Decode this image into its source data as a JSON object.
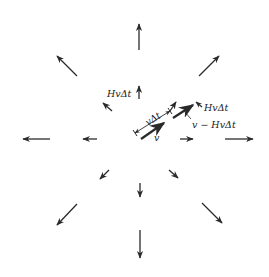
{
  "diagram": {
    "stroke_color": "#2a2a2a",
    "labels": {
      "hv_dt_left": "HvΔt",
      "v_dt": "vΔt",
      "v": "v",
      "hv_dt_right": "HvΔt",
      "v_minus_hv_dt": "v − HvΔt"
    },
    "outer_arrows": [
      {
        "name": "arrow-up-large",
        "x1": 139,
        "y1": 50,
        "x2": 139,
        "y2": 24
      },
      {
        "name": "arrow-down-large",
        "x1": 140,
        "y1": 230,
        "x2": 140,
        "y2": 258
      },
      {
        "name": "arrow-left-large",
        "x1": 50,
        "y1": 139,
        "x2": 23,
        "y2": 139
      },
      {
        "name": "arrow-right-large",
        "x1": 225,
        "y1": 139,
        "x2": 253,
        "y2": 139
      },
      {
        "name": "arrow-upleft-large",
        "x1": 77,
        "y1": 76,
        "x2": 57,
        "y2": 56
      },
      {
        "name": "arrow-upright-large",
        "x1": 199,
        "y1": 76,
        "x2": 219,
        "y2": 56
      },
      {
        "name": "arrow-downleft-large",
        "x1": 77,
        "y1": 204,
        "x2": 57,
        "y2": 225
      },
      {
        "name": "arrow-downright-large",
        "x1": 202,
        "y1": 203,
        "x2": 222,
        "y2": 223
      }
    ],
    "inner_arrows": [
      {
        "name": "arrow-up-small",
        "x1": 139,
        "y1": 99,
        "x2": 139,
        "y2": 86
      },
      {
        "name": "arrow-down-small",
        "x1": 140,
        "y1": 183,
        "x2": 140,
        "y2": 197
      },
      {
        "name": "arrow-left-small",
        "x1": 97,
        "y1": 139,
        "x2": 83,
        "y2": 139
      },
      {
        "name": "arrow-right-small",
        "x1": 180,
        "y1": 139,
        "x2": 193,
        "y2": 139
      },
      {
        "name": "arrow-upleft-small",
        "x1": 112,
        "y1": 111,
        "x2": 103,
        "y2": 103
      },
      {
        "name": "arrow-downleft-small",
        "x1": 109,
        "y1": 170,
        "x2": 100,
        "y2": 179
      },
      {
        "name": "arrow-downright-small",
        "x1": 169,
        "y1": 170,
        "x2": 178,
        "y2": 178
      },
      {
        "name": "arrow-upright-small",
        "x1": 170,
        "y1": 111,
        "x2": 176,
        "y2": 102
      }
    ]
  }
}
